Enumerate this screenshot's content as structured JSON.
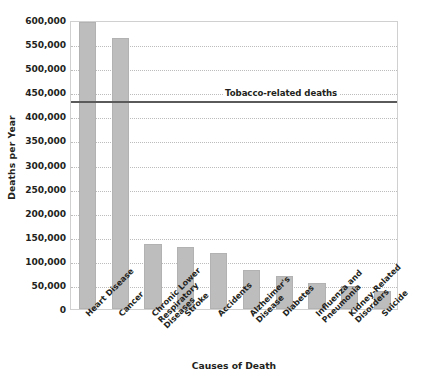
{
  "chart_data": {
    "type": "bar",
    "title": "",
    "xlabel": "Causes of Death",
    "ylabel": "Deaths per Year",
    "ylim": [
      0,
      600000
    ],
    "ytick_values": [
      0,
      50000,
      100000,
      150000,
      200000,
      250000,
      300000,
      350000,
      400000,
      450000,
      500000,
      550000,
      600000
    ],
    "ytick_labels": [
      "0",
      "50,000",
      "100,000",
      "150,000",
      "200,000",
      "250,000",
      "300,000",
      "350,000",
      "400,000",
      "450,000",
      "500,000",
      "550,000",
      "600,000"
    ],
    "grid": true,
    "legend": "none",
    "categories": [
      "Heart Disease",
      "Cancer",
      "Chronic Lower\nRespiratory\nDiseases",
      "Stroke",
      "Accidents",
      "Alzheimer's\nDisease",
      "Diabetes",
      "Influenza and\nPneumonia",
      "Kidney-Related\nDisorders",
      "Suicide"
    ],
    "values": [
      596000,
      562000,
      135000,
      128000,
      117000,
      80000,
      69000,
      55000,
      48000,
      38000
    ],
    "bar_color": "#bdbdbd",
    "annotations": [
      {
        "type": "hline",
        "label": "Tobacco-related deaths",
        "value": 435000,
        "color": "#5a5a5a"
      }
    ]
  }
}
